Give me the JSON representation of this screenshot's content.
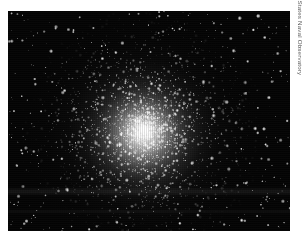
{
  "page": {
    "background_color": "#ffffff",
    "width": 305,
    "height": 240
  },
  "photo": {
    "name": "globular-star-cluster-photograph",
    "alt_text": "Globular star cluster",
    "frame": {
      "left": 8,
      "top": 11,
      "width": 282,
      "height": 220
    },
    "background_color": "#040404",
    "core": {
      "center_x_percent": 48.5,
      "center_y_percent": 54,
      "color": "#ffffff",
      "description": "dense unresolved white core glow fading outward into resolved stars"
    },
    "artifacts": [
      {
        "name": "scan-band-upper",
        "top": 176,
        "height": 9
      },
      {
        "name": "scan-band-lower",
        "top": 198,
        "height": 5
      }
    ]
  },
  "credit": {
    "text": "© United States Naval Observatory",
    "color": "#5a5a5a",
    "orientation": "vertical-rotated-90"
  }
}
